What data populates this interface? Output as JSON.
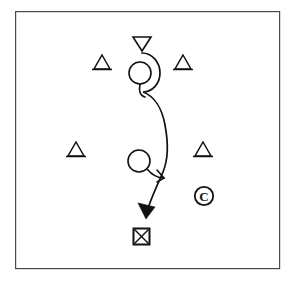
{
  "diagram": {
    "type": "tactical-play-diagram",
    "background_color": "#ffffff",
    "ink_color": "#111111",
    "frame_color": "#4a4a4a",
    "frame": {
      "x": 15,
      "y": 11,
      "width": 265,
      "height": 258,
      "label": "field-boundary"
    },
    "labels": {
      "coach_marker": "C"
    },
    "markers": {
      "start_triangle_down": {
        "name": "start-marker",
        "cx": 142,
        "cy": 44,
        "half_width": 9,
        "height": 14,
        "orientation": "down"
      },
      "triangles_up": [
        {
          "name": "defender-top-left",
          "cx": 102,
          "cy": 69,
          "half_width": 8,
          "height": 14
        },
        {
          "name": "defender-top-right",
          "cx": 183,
          "cy": 69,
          "half_width": 8,
          "height": 14
        },
        {
          "name": "defender-bottom-left",
          "cx": 76,
          "cy": 156,
          "half_width": 8,
          "height": 14
        },
        {
          "name": "defender-bottom-right",
          "cx": 203,
          "cy": 156,
          "half_width": 8,
          "height": 14
        }
      ],
      "circles": [
        {
          "name": "player-upper",
          "cx": 140,
          "cy": 73,
          "r": 11
        },
        {
          "name": "player-lower",
          "cx": 139,
          "cy": 161,
          "r": 11
        }
      ],
      "target_box": {
        "name": "target-marker",
        "x": 133,
        "y": 228,
        "size": 17,
        "fill_pattern": "cross"
      },
      "coach_circle": {
        "name": "coach-marker",
        "cx": 204,
        "cy": 196,
        "r": 9.5
      }
    },
    "paths": {
      "main_route": {
        "name": "ball-route",
        "d": "M 142 53 C 152 53 160 62 160 73 C 160 84 152 92 143 92 C 154 96 162 108 165 125 C 169 146 168 160 163 172 C 157 186 150 200 146 215",
        "has_arrowhead": true
      },
      "upper_hook": {
        "name": "upper-player-hook",
        "d": "M 140 84 C 140 90 140 94 144 96"
      },
      "lower_hook": {
        "name": "lower-player-hook",
        "d": "M 147 169 C 152 175 157 178 163 178"
      },
      "block_notch": {
        "name": "block-crossing-notch",
        "d": "M 156 171 L 163 178 L 157 181"
      },
      "arrow_head": {
        "name": "route-arrowhead",
        "d": "M 146 216 L 140 204 L 154 208 Z",
        "tip_x": 146,
        "tip_y": 219
      }
    }
  }
}
